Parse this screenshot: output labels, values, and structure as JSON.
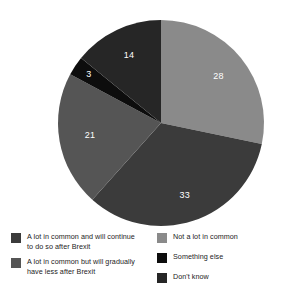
{
  "chart_data": {
    "type": "pie",
    "title": "",
    "subtitle": "",
    "xlabel": "",
    "ylabel": "",
    "grid": false,
    "legend_position": "bottom",
    "start_angle_deg": 0,
    "direction": "clockwise",
    "categories": [
      "Not a lot in common",
      "A lot in common and will continue to do so after Brexit",
      "A lot in common but will gradually have less after Brexit",
      "Something else",
      "Don't know"
    ],
    "values": [
      28,
      33,
      21,
      3,
      14
    ],
    "value_labels": [
      "28",
      "33",
      "21",
      "3",
      "14"
    ],
    "colors": [
      "#8a8a8a",
      "#3b3b3b",
      "#555555",
      "#0d0d0d",
      "#262626"
    ],
    "slices": [
      {
        "label": "Not a lot in common",
        "value": 28,
        "value_label": "28",
        "color": "#8a8a8a"
      },
      {
        "label": "A lot in common and will continue to do so after Brexit",
        "value": 33,
        "value_label": "33",
        "color": "#3b3b3b"
      },
      {
        "label": "A lot in common but will gradually have less after Brexit",
        "value": 21,
        "value_label": "21",
        "color": "#555555"
      },
      {
        "label": "Something else",
        "value": 3,
        "value_label": "3",
        "color": "#0d0d0d"
      },
      {
        "label": "Don't know",
        "value": 14,
        "value_label": "14",
        "color": "#262626"
      }
    ],
    "total": 99
  },
  "legend": {
    "left_column": [
      {
        "label": "A lot in common and will continue\nto do so after Brexit",
        "color": "#3b3b3b"
      },
      {
        "label": "A lot in common but will gradually\nhave less after Brexit",
        "color": "#555555"
      }
    ],
    "right_column": [
      {
        "label": "Not a lot in common",
        "color": "#8a8a8a"
      },
      {
        "label": "Something else",
        "color": "#0d0d0d"
      },
      {
        "label": "Don't know",
        "color": "#262626"
      }
    ]
  },
  "geometry": {
    "center_x": 161,
    "center_y": 123,
    "radius": 103
  }
}
